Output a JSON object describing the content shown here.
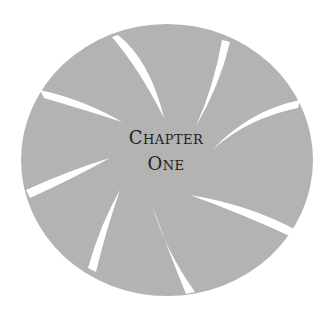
{
  "title": {
    "line1": "Chapter",
    "line2": "One"
  },
  "colors": {
    "disc": "#b3b3b3",
    "background": "#ffffff",
    "text": "#222222"
  },
  "shape": {
    "type": "shutter-disc",
    "blades": 9,
    "center": [
      167,
      160
    ],
    "radius": [
      146,
      136
    ]
  }
}
